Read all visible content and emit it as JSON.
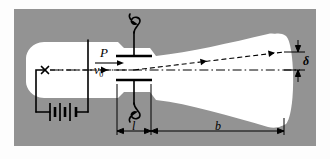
{
  "figure": {
    "kind": "crt-deflection-diagram",
    "background_color": "#939393",
    "page_color": "#fdfdfd",
    "tube_color": "#ffffff",
    "ink_color": "#000000"
  },
  "labels": {
    "plate": "P",
    "velocity": "v",
    "velocity_subscript": "0",
    "plate_length": "l",
    "screen_distance": "b",
    "deflection": "δ"
  },
  "elements": {
    "cathode_marker": "x",
    "battery": "battery-symbol",
    "anode": "anode-line",
    "upper_plate": "deflecting-plate-upper",
    "lower_plate": "deflecting-plate-lower",
    "upper_lead": "pigtail-lead-upper",
    "lower_lead": "pigtail-lead-lower",
    "beam_dashed": "deflected-electron-beam",
    "axis_dashdot": "tube-optical-axis",
    "screen": "phosphor-screen"
  },
  "geometry": {
    "panel": {
      "x": 14,
      "y": 9,
      "w": 302,
      "h": 137
    },
    "axis_y": 70,
    "cathode_x": 45,
    "anode_x": 88,
    "plate_left_x": 115,
    "plate_right_x": 148,
    "screen_x": 285,
    "deflection_top_y": 52
  }
}
